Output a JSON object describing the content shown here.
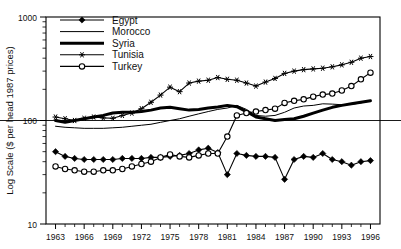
{
  "chart_data": {
    "type": "line",
    "title": "",
    "xlabel": "",
    "ylabel": "Log Scale ($ per head 1987 prices)",
    "scale": "log",
    "ylim": [
      10,
      1000
    ],
    "ytick_labels": [
      "1000",
      "100",
      "10"
    ],
    "ytick_values": [
      1000,
      100,
      10
    ],
    "xlim": [
      1962,
      1997
    ],
    "grid": "single horizontal line at 100",
    "legend_position": "top-left inside plot",
    "x": [
      1963,
      1964,
      1965,
      1966,
      1967,
      1968,
      1969,
      1970,
      1971,
      1972,
      1973,
      1974,
      1975,
      1976,
      1977,
      1978,
      1979,
      1980,
      1981,
      1982,
      1983,
      1984,
      1985,
      1986,
      1987,
      1988,
      1989,
      1990,
      1991,
      1992,
      1993,
      1994,
      1995,
      1996
    ],
    "xtick_labels": [
      "1963",
      "1966",
      "1969",
      "1972",
      "1975",
      "1978",
      "1981",
      "1984",
      "1987",
      "1990",
      "1993",
      "1996"
    ],
    "xtick_values": [
      1963,
      1966,
      1969,
      1972,
      1975,
      1978,
      1981,
      1984,
      1987,
      1990,
      1993,
      1996
    ],
    "series": [
      {
        "name": "Egypt",
        "marker": "filled-diamond",
        "line_width": 1.1,
        "color": "#000000",
        "x": [
          1963,
          1964,
          1965,
          1966,
          1967,
          1968,
          1969,
          1970,
          1971,
          1972,
          1973,
          1974,
          1975,
          1976,
          1977,
          1978,
          1979,
          1980,
          1981,
          1982,
          1983,
          1984,
          1985,
          1986,
          1987,
          1988,
          1989,
          1990,
          1991,
          1992,
          1993,
          1994,
          1995,
          1996
        ],
        "values": [
          50,
          45,
          43,
          42,
          42,
          42,
          42,
          43,
          43,
          43,
          44,
          44,
          45,
          46,
          48,
          52,
          54,
          49,
          30,
          48,
          46,
          45,
          45,
          44,
          27,
          42,
          45,
          44,
          48,
          42,
          40,
          37,
          40,
          41
        ]
      },
      {
        "name": "Morocco",
        "marker": "none",
        "line_width": 1.0,
        "color": "#000000",
        "x": [
          1963,
          1964,
          1965,
          1966,
          1967,
          1968,
          1969,
          1970,
          1971,
          1972,
          1973,
          1974,
          1975,
          1976,
          1977,
          1978,
          1979,
          1980,
          1981,
          1982,
          1983,
          1984,
          1985,
          1986,
          1987,
          1988,
          1989,
          1990,
          1991,
          1992,
          1993,
          1994,
          1995,
          1996
        ],
        "values": [
          88,
          86,
          85,
          84,
          84,
          84,
          85,
          86,
          88,
          90,
          92,
          96,
          100,
          104,
          110,
          116,
          122,
          128,
          132,
          140,
          128,
          112,
          110,
          112,
          120,
          132,
          138,
          140,
          145,
          144,
          142,
          143,
          148,
          155
        ]
      },
      {
        "name": "Syria",
        "marker": "none",
        "line_width": 3.0,
        "color": "#000000",
        "x": [
          1963,
          1964,
          1965,
          1966,
          1967,
          1968,
          1969,
          1970,
          1971,
          1972,
          1973,
          1974,
          1975,
          1976,
          1977,
          1978,
          1979,
          1980,
          1981,
          1982,
          1983,
          1984,
          1985,
          1986,
          1987,
          1988,
          1989,
          1990,
          1991,
          1992,
          1993,
          1994,
          1995,
          1996
        ],
        "values": [
          100,
          96,
          100,
          104,
          108,
          112,
          118,
          120,
          120,
          122,
          126,
          132,
          134,
          130,
          126,
          128,
          132,
          135,
          140,
          136,
          122,
          108,
          104,
          100,
          102,
          104,
          110,
          118,
          126,
          134,
          140,
          145,
          150,
          155
        ]
      },
      {
        "name": "Tunisia",
        "marker": "asterisk",
        "line_width": 1.1,
        "color": "#000000",
        "x": [
          1963,
          1964,
          1965,
          1966,
          1967,
          1968,
          1969,
          1970,
          1971,
          1972,
          1973,
          1974,
          1975,
          1976,
          1977,
          1978,
          1979,
          1980,
          1981,
          1982,
          1983,
          1984,
          1985,
          1986,
          1987,
          1988,
          1989,
          1990,
          1991,
          1992,
          1993,
          1994,
          1995,
          1996
        ],
        "values": [
          108,
          104,
          100,
          105,
          108,
          106,
          105,
          112,
          118,
          130,
          150,
          176,
          210,
          190,
          230,
          240,
          245,
          260,
          250,
          245,
          230,
          215,
          235,
          255,
          285,
          300,
          310,
          315,
          320,
          330,
          345,
          365,
          400,
          415
        ]
      },
      {
        "name": "Turkey",
        "marker": "open-circle",
        "line_width": 1.1,
        "color": "#000000",
        "x": [
          1963,
          1964,
          1965,
          1966,
          1967,
          1968,
          1969,
          1970,
          1971,
          1972,
          1973,
          1974,
          1975,
          1976,
          1977,
          1978,
          1979,
          1980,
          1981,
          1982,
          1983,
          1984,
          1985,
          1986,
          1987,
          1988,
          1989,
          1990,
          1991,
          1992,
          1993,
          1994,
          1995,
          1996
        ],
        "values": [
          36,
          34,
          33,
          32,
          32,
          33,
          33,
          34,
          36,
          38,
          40,
          44,
          47,
          45,
          44,
          46,
          48,
          48,
          70,
          112,
          118,
          122,
          126,
          130,
          148,
          155,
          160,
          170,
          178,
          182,
          195,
          215,
          250,
          290
        ]
      }
    ],
    "legend": [
      {
        "label": "Egypt",
        "marker": "filled-diamond",
        "line_width": 1.1
      },
      {
        "label": "Morocco",
        "marker": "none",
        "line_width": 1.0
      },
      {
        "label": "Syria",
        "marker": "none",
        "line_width": 3.0
      },
      {
        "label": "Tunisia",
        "marker": "asterisk",
        "line_width": 1.1
      },
      {
        "label": "Turkey",
        "marker": "open-circle",
        "line_width": 1.1
      }
    ]
  }
}
